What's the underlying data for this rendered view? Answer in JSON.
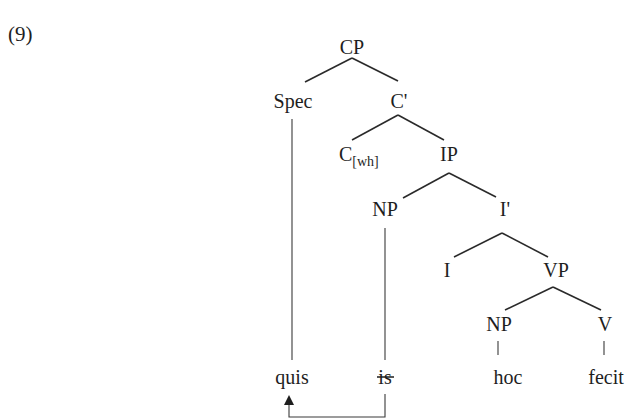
{
  "example_number": "(9)",
  "tree": {
    "nodes": {
      "cp": "CP",
      "spec": "Spec",
      "c_bar": "C'",
      "c_head": "C",
      "c_feature": "[wh]",
      "ip": "IP",
      "np_subject": "NP",
      "i_bar": "I'",
      "i_head": "I",
      "vp": "VP",
      "np_object": "NP",
      "v": "V"
    },
    "leaves": {
      "quis": "quis",
      "is": "is",
      "hoc": "hoc",
      "fecit": "fecit"
    },
    "struck_through_leaf": "is",
    "movement": {
      "from": "is",
      "to": "quis",
      "arrow": "arrow-up-icon"
    }
  }
}
